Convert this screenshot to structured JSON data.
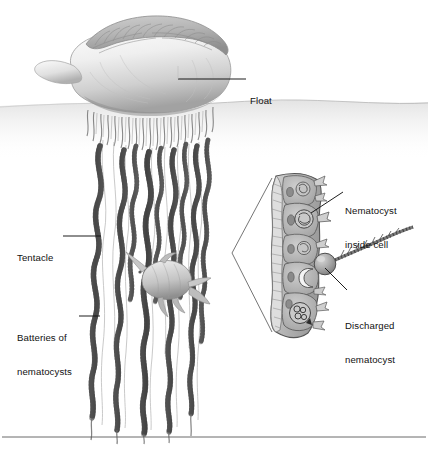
{
  "figure": {
    "organism": "Portuguese man-of-war",
    "background_color": "#ffffff",
    "ink_color": "#111111",
    "body_fill": "#e9e9e9",
    "body_shade": "#a8a8a8",
    "tentacle_color": "#6f6f6f",
    "inset_fill": "#bdbdbd",
    "leader_color": "#1a1a1a",
    "has_bottom_rule": true
  },
  "labels": [
    {
      "id": "float",
      "name": "float-label",
      "lines": [
        "Float"
      ],
      "text_x": 250,
      "text_y": 72,
      "leader": {
        "type": "horizontal",
        "x1": 178,
        "y1": 79,
        "x2": 244,
        "y2": 79
      },
      "anchor": "float-body"
    },
    {
      "id": "tentacle",
      "name": "tentacle-label",
      "lines": [
        "Tentacle"
      ],
      "text_x": 17,
      "text_y": 229,
      "leader": {
        "type": "horizontal",
        "x1": 62,
        "y1": 236,
        "x2": 100,
        "y2": 236
      },
      "anchor": "tentacle-strand"
    },
    {
      "id": "batteries",
      "name": "batteries-of-nematocysts-label",
      "lines": [
        "Batteries of",
        "nematocysts"
      ],
      "text_x": 17,
      "text_y": 309,
      "leader": {
        "type": "horizontal",
        "x1": 78,
        "y1": 316,
        "x2": 99,
        "y2": 316
      },
      "anchor": "nematocyst-battery"
    },
    {
      "id": "nematocyst_inside_cell",
      "name": "nematocyst-inside-cell-label",
      "lines": [
        "Nematocyst",
        "inside cell"
      ],
      "text_x": 345,
      "text_y": 182,
      "leader": {
        "type": "diagonal",
        "x1": 337,
        "y1": 193,
        "x2": 312,
        "y2": 212
      },
      "anchor": "cnidocyte-cell"
    },
    {
      "id": "discharged_nematocyst",
      "name": "discharged-nematocyst-label",
      "lines": [
        "Discharged",
        "nematocyst"
      ],
      "text_x": 345,
      "text_y": 297,
      "leader": {
        "type": "diagonal",
        "x1": 341,
        "y1": 291,
        "x2": 322,
        "y2": 265
      },
      "anchor": "discharged-capsule"
    }
  ],
  "scene": {
    "water_surface_y": 105,
    "float_crest_scallops": 17,
    "tentacle_count": 9,
    "fish_present": true,
    "inset_cell_count": 5,
    "inset_cnidocil_count": 6
  }
}
